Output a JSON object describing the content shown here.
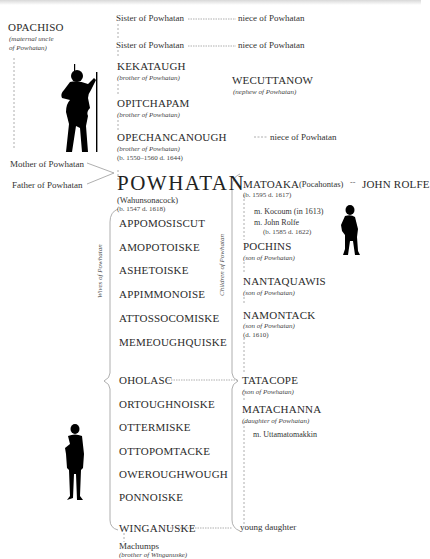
{
  "diagram": {
    "ancestors": {
      "uncle": {
        "name": "OPACHISO",
        "note_line1": "(maternal uncle",
        "note_line2": "of Powhatan)"
      },
      "mother": "Mother of Powhatan",
      "father": "Father of Powhatan"
    },
    "siblings": [
      {
        "name": "Sister of Powhatan",
        "child": "niece of Powhatan"
      },
      {
        "name": "Sister of Powhatan",
        "child": "niece of Powhatan"
      },
      {
        "name": "KEKATAUGH",
        "note": "(brother of Powhatan)"
      },
      {
        "name": "OPITCHAPAM",
        "note": "(brother of Powhatan)"
      },
      {
        "name": "OPECHANCANOUGH",
        "note": "(brother of Powhatan)",
        "dates": "(b. 1550–1560  d. 1644)",
        "child": "niece of Powhatan"
      }
    ],
    "nephew": {
      "name": "WECUTTANOW",
      "note": "(nephew of Powhatan)"
    },
    "central": {
      "name": "POWHATAN",
      "alias": "(Wahunsonacock)",
      "dates": "(b. 1547  d. 1618)"
    },
    "wives_label": "Wives of Powhatan",
    "wives": [
      "APPOMOSISCUT",
      "AMOPOTOISKE",
      "ASHETOISKE",
      "APPIMMONOISE",
      "ATTOSSOCOMISKE",
      "MEMEOUGHQUISKE",
      "OHOLASC",
      "ORTOUGHNOISKE",
      "OTTERMISKE",
      "OTTOPOMTACKE",
      "OWEROUGHWOUGH",
      "PONNOISKE",
      "WINGANUSKE"
    ],
    "wife_relative": {
      "name": "Machumps",
      "note": "(brother of Winganuske)"
    },
    "children_label": "Children of Powhatan",
    "children": {
      "matoaka": {
        "name": "MATOAKA",
        "alias": "(Pocahontas)",
        "spouse": "JOHN ROLFE",
        "dates": "(b. 1595  d. 1617)",
        "marriage1": "m. Kocoum (in 1613)",
        "marriage2": "m. John Rolfe",
        "marriage2_dates": "(b. 1585  d. 1622)"
      },
      "pochins": {
        "name": "POCHINS",
        "note": "(son of Powhatan)"
      },
      "nantaquawis": {
        "name": "NANTAQUAWIS",
        "note": "(son of Powhatan)"
      },
      "namontack": {
        "name": "NAMONTACK",
        "note": "(son of Powhatan)",
        "dates": "(d. 1610)"
      },
      "tatacope": {
        "name": "TATACOPE",
        "note": "(son of Powhatan)"
      },
      "matachanna": {
        "name": "MATACHANNA",
        "note": "(daughter of Powhatan)",
        "marriage": "m. Uttamatomakkin"
      },
      "young": {
        "name": "young daughter"
      }
    },
    "silhouettes": [
      "warrior-silhouette",
      "child-silhouette",
      "man-silhouette"
    ],
    "colors": {
      "text": "#2b2b2b",
      "lines": "#8a8a8a",
      "silhouette": "#000000"
    }
  }
}
